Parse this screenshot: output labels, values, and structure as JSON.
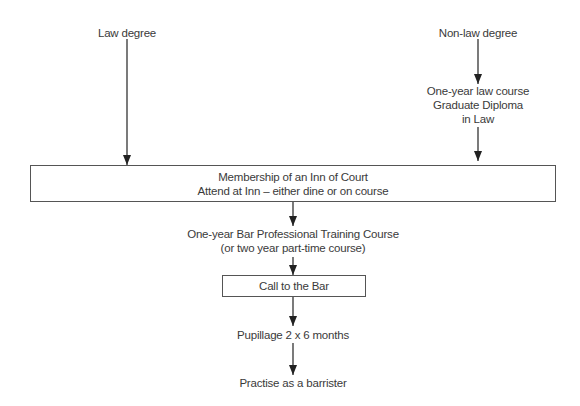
{
  "diagram": {
    "colors": {
      "line": "#222222",
      "border": "#555555",
      "text": "#3a3a3a",
      "background": "#ffffff"
    },
    "nodes": {
      "law_degree": {
        "label": "Law degree"
      },
      "non_law_degree": {
        "label": "Non-law degree"
      },
      "gdl": {
        "line1": "One-year law course",
        "line2": "Graduate Diploma",
        "line3": "in Law"
      },
      "inn_membership": {
        "line1": "Membership of an Inn of Court",
        "line2": "Attend at Inn – either dine or on course"
      },
      "bptc": {
        "line1": "One-year Bar Professional Training Course",
        "line2": "(or two year part-time course)"
      },
      "call_to_bar": {
        "label": "Call to the Bar"
      },
      "pupillage": {
        "label": "Pupillage 2 x 6 months"
      },
      "practise": {
        "label": "Practise as a barrister"
      }
    },
    "edges": [
      {
        "from": "law_degree",
        "to": "inn_membership"
      },
      {
        "from": "non_law_degree",
        "to": "gdl"
      },
      {
        "from": "gdl",
        "to": "inn_membership"
      },
      {
        "from": "inn_membership",
        "to": "bptc"
      },
      {
        "from": "bptc",
        "to": "call_to_bar"
      },
      {
        "from": "call_to_bar",
        "to": "pupillage"
      },
      {
        "from": "pupillage",
        "to": "practise"
      }
    ]
  }
}
